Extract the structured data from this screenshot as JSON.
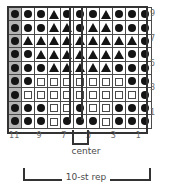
{
  "legend_symbols": {
    "dot": "filled-circle",
    "triangle": "filled-triangle",
    "square": "open-square",
    "shaded_cell": "gray-shaded-cell"
  },
  "colors": {
    "symbol": "#141414",
    "grid_line": "#4a4a4a",
    "heavy_line": "#333333",
    "shaded_cell": "#b4b4b4",
    "label_text": "#6b6b6b",
    "caption_text": "#4a4a4a",
    "background": "#ffffff"
  },
  "chart_data": {
    "type": "table",
    "xlabel": "",
    "ylabel": "",
    "columns": 11,
    "rows": 9,
    "column_labels": [
      "11",
      "",
      "9",
      "",
      "7",
      "",
      "5",
      "",
      "3",
      "",
      "1"
    ],
    "row_labels": [
      "9",
      "",
      "7",
      "",
      "5",
      "",
      "3",
      "",
      "1"
    ],
    "visible_column_labels": [
      "11",
      "9",
      "7",
      "5",
      "3",
      "1"
    ],
    "visible_row_labels": [
      "9",
      "7",
      "5",
      "3",
      "1"
    ],
    "shaded_column_index": 0,
    "center_column_index": 5,
    "legend": [
      "dot = filled circle",
      "triangle = filled triangle",
      "square = open square"
    ],
    "grid": [
      [
        "dot",
        "dot",
        "dot",
        "tri",
        "dot",
        "dot",
        "dot",
        "tri",
        "dot",
        "dot",
        "dot"
      ],
      [
        "dot",
        "dot",
        "dot",
        "tri",
        "tri",
        "dot",
        "tri",
        "tri",
        "dot",
        "dot",
        "dot"
      ],
      [
        "dot",
        "tri",
        "tri",
        "tri",
        "tri",
        "tri",
        "tri",
        "tri",
        "tri",
        "tri",
        "dot"
      ],
      [
        "dot",
        "dot",
        "tri",
        "tri",
        "tri",
        "tri",
        "tri",
        "tri",
        "tri",
        "dot",
        "dot"
      ],
      [
        "dot",
        "dot",
        "dot",
        "tri",
        "tri",
        "tri",
        "tri",
        "tri",
        "dot",
        "dot",
        "dot"
      ],
      [
        "dot",
        "dot",
        "sq",
        "sq",
        "sq",
        "sq",
        "sq",
        "sq",
        "sq",
        "dot",
        "dot"
      ],
      [
        "dot",
        "sq",
        "sq",
        "sq",
        "sq",
        "sq",
        "sq",
        "sq",
        "sq",
        "sq",
        "dot"
      ],
      [
        "dot",
        "dot",
        "dot",
        "sq",
        "sq",
        "dot",
        "sq",
        "sq",
        "dot",
        "dot",
        "dot"
      ],
      [
        "dot",
        "dot",
        "dot",
        "sq",
        "dot",
        "dot",
        "dot",
        "sq",
        "dot",
        "dot",
        "dot"
      ]
    ]
  },
  "annotations": {
    "center_label": "center",
    "repeat_label": "10-st rep"
  }
}
